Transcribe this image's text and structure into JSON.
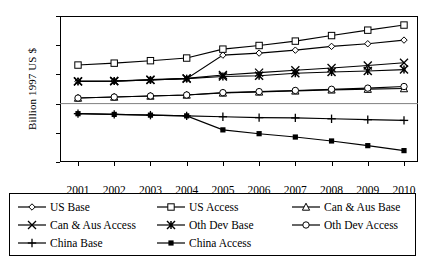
{
  "chart_data": {
    "type": "line",
    "title": "",
    "xlabel": "",
    "ylabel": "Billion 1997 US $",
    "x": [
      2001,
      2002,
      2003,
      2004,
      2005,
      2006,
      2007,
      2008,
      2009,
      2010
    ],
    "xtick_labels": [
      "2001",
      "2002",
      "2003",
      "2004",
      "2005",
      "2006",
      "2007",
      "2008",
      "2009",
      "2010"
    ],
    "ytick_labels": [
      "60",
      "40",
      "20",
      "0",
      "-20",
      "-40"
    ],
    "ytick_values": [
      60,
      40,
      20,
      0,
      -20,
      -40
    ],
    "ylim": [
      -40,
      60
    ],
    "grid": false,
    "legend_position": "bottom",
    "series": [
      {
        "name": "US Base",
        "marker": "open-diamond",
        "values": [
          15.3,
          15.4,
          16.2,
          17.0,
          33.2,
          34.6,
          36.6,
          39.2,
          41.0,
          43.5
        ]
      },
      {
        "name": "US Access",
        "marker": "open-square",
        "values": [
          26.4,
          27.7,
          29.4,
          31.2,
          37.3,
          39.8,
          42.8,
          46.6,
          50.3,
          53.8
        ]
      },
      {
        "name": "Can & Aus Base",
        "marker": "open-triangle",
        "values": [
          3.8,
          4.5,
          5.2,
          5.9,
          7.3,
          8.0,
          8.7,
          9.4,
          9.9,
          10.3
        ]
      },
      {
        "name": "Can & Aus Access",
        "marker": "cross-x",
        "values": [
          15.3,
          15.5,
          16.4,
          17.3,
          19.6,
          21.2,
          22.8,
          24.4,
          26.1,
          28.0
        ]
      },
      {
        "name": "Oth Dev Base",
        "marker": "filled-star",
        "values": [
          15.2,
          15.4,
          16.2,
          17.1,
          18.6,
          19.1,
          20.8,
          21.6,
          22.3,
          23.3
        ]
      },
      {
        "name": "Oth Dev Access",
        "marker": "open-circle",
        "values": [
          3.8,
          4.5,
          5.2,
          5.9,
          7.5,
          8.2,
          9.0,
          9.8,
          10.6,
          11.7
        ]
      },
      {
        "name": "China Base",
        "marker": "plus",
        "values": [
          -6.9,
          -7.4,
          -7.9,
          -8.4,
          -9.0,
          -9.6,
          -9.8,
          -10.4,
          -11.0,
          -11.5
        ]
      },
      {
        "name": "China Access",
        "marker": "filled-square",
        "values": [
          -6.9,
          -7.4,
          -7.9,
          -8.4,
          -18.0,
          -20.6,
          -22.9,
          -25.6,
          -28.8,
          -32.2
        ]
      }
    ]
  },
  "legend": {
    "rows": [
      [
        {
          "label": "US Base",
          "marker": "open-diamond"
        },
        {
          "label": "US Access",
          "marker": "open-square"
        },
        {
          "label": "Can & Aus Base",
          "marker": "open-triangle"
        }
      ],
      [
        {
          "label": "Can & Aus Access",
          "marker": "cross-x"
        },
        {
          "label": "Oth Dev Base",
          "marker": "filled-star"
        },
        {
          "label": "Oth Dev Access",
          "marker": "open-circle"
        }
      ],
      [
        {
          "label": "China Base",
          "marker": "plus"
        },
        {
          "label": "China Access",
          "marker": "filled-square"
        }
      ]
    ]
  },
  "colors": {
    "line": "#000000",
    "frame": "#000000",
    "background": "#ffffff"
  }
}
